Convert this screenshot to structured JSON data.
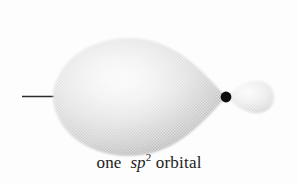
{
  "figure": {
    "background_color": "#fdfdfd",
    "caption": {
      "prefix": "one",
      "symbol": "sp",
      "superscript": "2",
      "suffix": "orbital",
      "full_text": "one sp2 orbital",
      "color": "#1c1c1c"
    },
    "elements": {
      "large_lobe": {
        "name": "large-lobe",
        "shape": "teardrop",
        "direction": "left",
        "fill_light": "#fbfbfb",
        "fill_mid": "#d9d9d9",
        "fill_dark": "#a9a9a9",
        "bounds": {
          "x": 55,
          "y": 38,
          "width": 172,
          "height": 116
        }
      },
      "small_lobe": {
        "name": "small-back-lobe",
        "shape": "teardrop",
        "direction": "right",
        "fill_light": "#fafafa",
        "fill_mid": "#dedede",
        "fill_dark": "#b5b5b5",
        "bounds": {
          "x": 228,
          "y": 80,
          "width": 46,
          "height": 34
        }
      },
      "nucleus": {
        "name": "nucleus-dot",
        "color": "#0d0d0d",
        "center_x": 226,
        "center_y": 97,
        "radius": 5.4
      },
      "bond_line": {
        "name": "bond-line",
        "color": "#2b2b2b",
        "x1": 22,
        "y1": 96,
        "x2": 58,
        "y2": 96,
        "stroke_width": 1.3
      }
    }
  }
}
